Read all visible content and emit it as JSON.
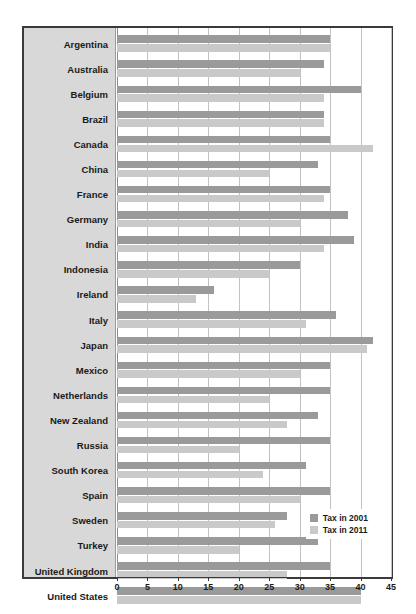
{
  "watermark": "",
  "chart_data": {
    "type": "bar",
    "orientation": "horizontal",
    "title": "",
    "xlabel": "",
    "ylabel": "",
    "xlim": [
      0,
      45
    ],
    "xticks": [
      0,
      5,
      10,
      15,
      20,
      25,
      30,
      35,
      40,
      45
    ],
    "grid": true,
    "legend_position": "inside-bottom-right",
    "categories": [
      "Argentina",
      "Australia",
      "Belgium",
      "Brazil",
      "Canada",
      "China",
      "France",
      "Germany",
      "India",
      "Indonesia",
      "Ireland",
      "Italy",
      "Japan",
      "Mexico",
      "Netherlands",
      "New Zealand",
      "Russia",
      "South Korea",
      "Spain",
      "Sweden",
      "Turkey",
      "United Kingdom",
      "United States"
    ],
    "series": [
      {
        "name": "Tax in 2001",
        "color": "#9a9a9a",
        "values": [
          35,
          34,
          40,
          34,
          35,
          33,
          35,
          38,
          39,
          30,
          16,
          36,
          42,
          35,
          35,
          33,
          35,
          31,
          35,
          28,
          33,
          35,
          40
        ]
      },
      {
        "name": "Tax in 2011",
        "color": "#c9c9c9",
        "values": [
          35,
          30,
          34,
          34,
          42,
          25,
          34,
          30,
          34,
          25,
          13,
          31,
          41,
          30,
          25,
          28,
          20,
          24,
          30,
          26,
          20,
          28,
          40
        ]
      }
    ]
  },
  "legend": {
    "items": [
      {
        "label": "Tax in 2001",
        "color": "#9a9a9a"
      },
      {
        "label": "Tax in 2011",
        "color": "#c9c9c9"
      }
    ]
  },
  "colors": {
    "panel_background": "#d8d8d8",
    "plot_background": "#ffffff",
    "frame_border": "#3a3a3a",
    "gridline": "#c2c2c2",
    "bar_2001": "#9a9a9a",
    "bar_2011": "#c9c9c9",
    "text": "#1a1a1a"
  }
}
